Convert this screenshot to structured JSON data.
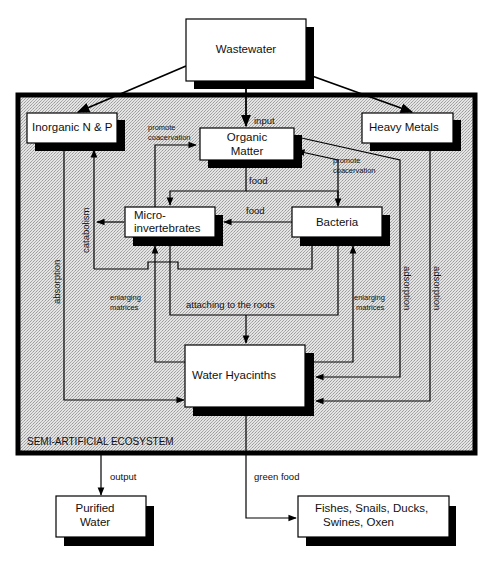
{
  "colors": {
    "background": "#ffffff",
    "ecosystem_fill": "#d9d9d9",
    "border": "#000000",
    "box_fill": "#ffffff",
    "shadow": "#000000",
    "text": "#111111"
  },
  "ecosystem": {
    "label": "SEMI-ARTIFICIAL ECOSYSTEM"
  },
  "nodes": {
    "wastewater": "Wastewater",
    "inorganic_np": "Inorganic N & P",
    "organic_matter_line1": "Organic",
    "organic_matter_line2": "Matter",
    "heavy_metals": "Heavy Metals",
    "micro_line1": "Micro-",
    "micro_line2": "invertebrates",
    "bacteria": "Bacteria",
    "water_hyacinths": "Water Hyacinths",
    "purified_line1": "Purified",
    "purified_line2": "Water",
    "consumers_line1": "Fishes, Snails, Ducks,",
    "consumers_line2": "Swines, Oxen"
  },
  "edge_labels": {
    "input": "input",
    "promote_coacervation_left_1": "promote",
    "promote_coacervation_left_2": "coacervation",
    "promote_coacervation_right_1": "promote",
    "promote_coacervation_right_2": "coacervation",
    "food_top": "food",
    "food_mid": "food",
    "catabolism": "catabolism",
    "absorption": "absorption",
    "enlarging_left_1": "enlarging",
    "enlarging_left_2": "matrices",
    "enlarging_right_1": "enlarging",
    "enlarging_right_2": "matrices",
    "attaching": "attaching to the roots",
    "adsorption_1": "adsorption",
    "adsorption_2": "adsorption",
    "output": "output",
    "green_food": "green food"
  },
  "edges": [
    {
      "from": "Wastewater",
      "to": "Inorganic N & P",
      "label": ""
    },
    {
      "from": "Wastewater",
      "to": "Organic Matter",
      "label": "input"
    },
    {
      "from": "Wastewater",
      "to": "Heavy Metals",
      "label": ""
    },
    {
      "from": "Micro-invertebrates",
      "to": "Organic Matter",
      "label": "promote coacervation"
    },
    {
      "from": "Bacteria",
      "to": "Organic Matter",
      "label": "promote coacervation"
    },
    {
      "from": "Organic Matter",
      "to": "Micro-invertebrates",
      "label": "food"
    },
    {
      "from": "Organic Matter",
      "to": "Bacteria",
      "label": "food"
    },
    {
      "from": "Bacteria",
      "to": "Micro-invertebrates",
      "label": "food"
    },
    {
      "from": "Micro-invertebrates",
      "to": "Inorganic N & P",
      "label": "catabolism"
    },
    {
      "from": "Bacteria",
      "to": "Inorganic N & P",
      "label": "catabolism"
    },
    {
      "from": "Inorganic N & P",
      "to": "Water Hyacinths",
      "label": "absorption"
    },
    {
      "from": "Water Hyacinths",
      "to": "Micro-invertebrates",
      "label": "enlarging matrices"
    },
    {
      "from": "Water Hyacinths",
      "to": "Bacteria",
      "label": "enlarging matrices"
    },
    {
      "from": "Micro-invertebrates",
      "to": "Water Hyacinths",
      "label": "attaching to the roots"
    },
    {
      "from": "Bacteria",
      "to": "Water Hyacinths",
      "label": "attaching to the roots"
    },
    {
      "from": "Organic Matter",
      "to": "Water Hyacinths",
      "label": "adsorption"
    },
    {
      "from": "Heavy Metals",
      "to": "Water Hyacinths",
      "label": "adsorption"
    },
    {
      "from": "Semi-Artificial Ecosystem",
      "to": "Purified Water",
      "label": "output"
    },
    {
      "from": "Water Hyacinths",
      "to": "Fishes, Snails, Ducks, Swines, Oxen",
      "label": "green food"
    }
  ]
}
